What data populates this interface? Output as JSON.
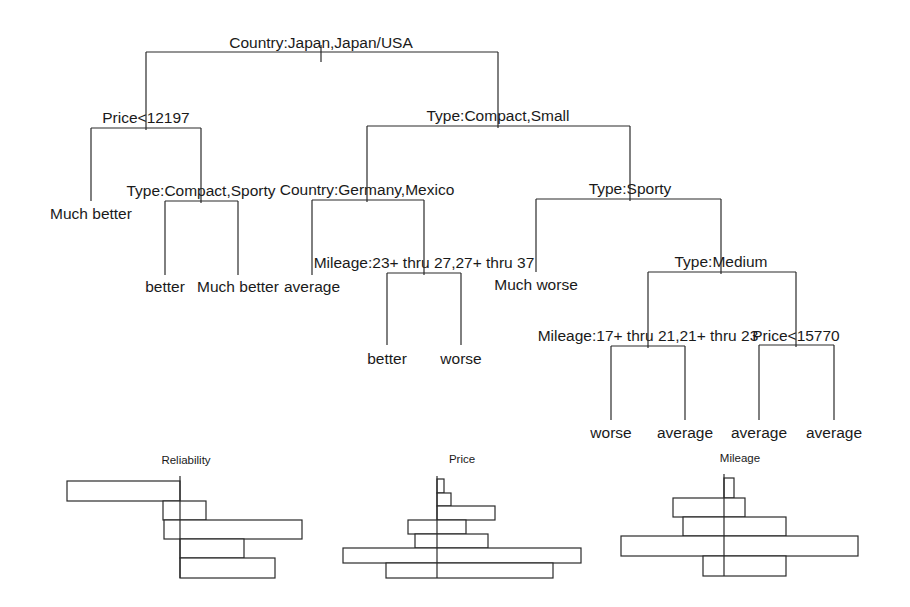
{
  "tree": {
    "root_stem": {
      "x": 321,
      "y1": 45,
      "y2": 62
    },
    "nodes": [
      {
        "id": "n_country1",
        "label": "Country:Japan,Japan/USA",
        "label_x": 321,
        "label_y": 48,
        "y": 52,
        "x_left": 146,
        "x_right": 498,
        "stem_x": 321
      },
      {
        "id": "n_price1",
        "label": "Price<12197",
        "label_x": 146,
        "label_y": 123,
        "y": 128,
        "x_left": 91,
        "x_right": 201,
        "stem_x": 146
      },
      {
        "id": "n_type1",
        "label": "Type:Compact,Small",
        "label_x": 498,
        "label_y": 121,
        "y": 126,
        "x_left": 367,
        "x_right": 630,
        "stem_x": 498
      },
      {
        "id": "n_type2",
        "label": "Type:Compact,Sporty",
        "label_x": 201,
        "label_y": 196,
        "y": 201,
        "x_left": 165,
        "x_right": 238,
        "stem_x": 201
      },
      {
        "id": "n_country2",
        "label": "Country:Germany,Mexico",
        "label_x": 367,
        "label_y": 195,
        "y": 200,
        "x_left": 312,
        "x_right": 424,
        "stem_x": 367
      },
      {
        "id": "n_type3",
        "label": "Type:Sporty",
        "label_x": 630,
        "label_y": 194,
        "y": 199,
        "x_left": 536,
        "x_right": 721,
        "stem_x": 630
      },
      {
        "id": "n_mileage1",
        "label": "Mileage:23+ thru 27,27+ thru 37",
        "label_x": 424,
        "label_y": 268,
        "y": 273,
        "x_left": 387,
        "x_right": 461,
        "stem_x": 424
      },
      {
        "id": "n_type4",
        "label": "Type:Medium",
        "label_x": 721,
        "label_y": 267,
        "y": 272,
        "x_left": 648,
        "x_right": 796,
        "stem_x": 721
      },
      {
        "id": "n_mileage2",
        "label": "Mileage:17+ thru 21,21+ thru 23",
        "label_x": 648,
        "label_y": 341,
        "y": 346,
        "x_left": 611,
        "x_right": 685,
        "stem_x": 648
      },
      {
        "id": "n_price2",
        "label": "Price<15770",
        "label_x": 796,
        "label_y": 341,
        "y": 345,
        "x_left": 759,
        "x_right": 834,
        "stem_x": 796
      }
    ],
    "leaves": [
      {
        "label": "Much better",
        "x": 91,
        "y_top": 128,
        "y_bottom": 201,
        "label_y": 219
      },
      {
        "label": "better",
        "x": 165,
        "y_top": 201,
        "y_bottom": 275,
        "label_y": 292
      },
      {
        "label": "Much better",
        "x": 238,
        "y_top": 201,
        "y_bottom": 275,
        "label_y": 292
      },
      {
        "label": "average",
        "x": 312,
        "y_top": 200,
        "y_bottom": 275,
        "label_y": 292
      },
      {
        "label": "better",
        "x": 387,
        "y_top": 273,
        "y_bottom": 345,
        "label_y": 364
      },
      {
        "label": "worse",
        "x": 461,
        "y_top": 273,
        "y_bottom": 345,
        "label_y": 364
      },
      {
        "label": "Much worse",
        "x": 536,
        "y_top": 199,
        "y_bottom": 272,
        "label_y": 290
      },
      {
        "label": "worse",
        "x": 611,
        "y_top": 346,
        "y_bottom": 420,
        "label_y": 438
      },
      {
        "label": "average",
        "x": 685,
        "y_top": 346,
        "y_bottom": 420,
        "label_y": 438
      },
      {
        "label": "average",
        "x": 759,
        "y_top": 345,
        "y_bottom": 420,
        "label_y": 438
      },
      {
        "label": "average",
        "x": 834,
        "y_top": 345,
        "y_bottom": 420,
        "label_y": 438
      }
    ]
  },
  "panels": [
    {
      "title": "Reliability",
      "title_x": 186,
      "title_y": 464,
      "axis": {
        "x": 180,
        "y1": 476,
        "y2": 578
      },
      "bars": [
        {
          "x1": 67,
          "x2": 180,
          "y1": 481,
          "y2": 501
        },
        {
          "x1": 163,
          "x2": 206,
          "y1": 501,
          "y2": 520
        },
        {
          "x1": 164,
          "x2": 302,
          "y1": 520,
          "y2": 539
        },
        {
          "x1": 180,
          "x2": 244,
          "y1": 539,
          "y2": 558
        },
        {
          "x1": 180,
          "x2": 275,
          "y1": 558,
          "y2": 578
        }
      ]
    },
    {
      "title": "Price",
      "title_x": 462,
      "title_y": 463,
      "axis": {
        "x": 437,
        "y1": 476,
        "y2": 578
      },
      "bars": [
        {
          "x1": 437,
          "x2": 444,
          "y1": 479,
          "y2": 493
        },
        {
          "x1": 437,
          "x2": 451,
          "y1": 493,
          "y2": 506
        },
        {
          "x1": 437,
          "x2": 495,
          "y1": 506,
          "y2": 520
        },
        {
          "x1": 408,
          "x2": 466,
          "y1": 520,
          "y2": 534
        },
        {
          "x1": 415,
          "x2": 488,
          "y1": 534,
          "y2": 548
        },
        {
          "x1": 343,
          "x2": 581,
          "y1": 548,
          "y2": 563
        },
        {
          "x1": 386,
          "x2": 553,
          "y1": 563,
          "y2": 578
        }
      ]
    },
    {
      "title": "Mileage",
      "title_x": 740,
      "title_y": 462,
      "axis": {
        "x": 724,
        "y1": 474,
        "y2": 576
      },
      "bars": [
        {
          "x1": 724,
          "x2": 734,
          "y1": 478,
          "y2": 498
        },
        {
          "x1": 673,
          "x2": 745,
          "y1": 498,
          "y2": 517
        },
        {
          "x1": 683,
          "x2": 786,
          "y1": 517,
          "y2": 536
        },
        {
          "x1": 621,
          "x2": 858,
          "y1": 536,
          "y2": 556
        },
        {
          "x1": 703,
          "x2": 786,
          "y1": 556,
          "y2": 576
        }
      ]
    }
  ]
}
